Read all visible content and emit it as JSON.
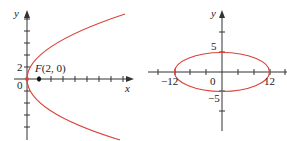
{
  "colors": {
    "curve": "#d9453b",
    "axis": "#333333",
    "background": "#ffffff"
  },
  "left_graph": {
    "type": "parabola",
    "x_axis_label": "x",
    "y_axis_label": "y",
    "origin_label": "0",
    "y_tick_label": "2",
    "focus_label": "F(2, 0)"
  },
  "right_graph": {
    "type": "ellipse",
    "y_axis_label": "y",
    "origin_label": "0",
    "x_tick_labels": {
      "left": "−12",
      "right": "12"
    },
    "y_tick_labels": {
      "top": "5",
      "bottom": "−5"
    }
  }
}
